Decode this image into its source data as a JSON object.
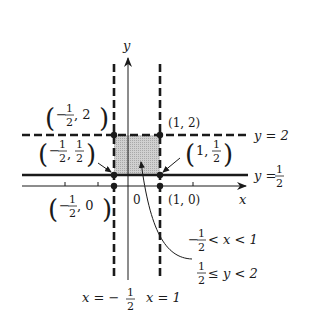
{
  "diagram": {
    "type": "coordinate-plane-region",
    "axes": {
      "x_label": "x",
      "y_label": "y",
      "origin_label": "0"
    },
    "boundary_lines": [
      {
        "id": "x_neg_half",
        "equation_lhs": "x =",
        "equation_rhs_sign": "−",
        "num": "1",
        "den": "2",
        "style": "dashed",
        "orientation": "vertical"
      },
      {
        "id": "x_one",
        "equation": "x = 1",
        "style": "dashed",
        "orientation": "vertical"
      },
      {
        "id": "y_two",
        "equation": "y = 2",
        "style": "dashed",
        "orientation": "horizontal"
      },
      {
        "id": "y_half",
        "equation_lhs": "y =",
        "num": "1",
        "den": "2",
        "style": "solid",
        "orientation": "horizontal"
      }
    ],
    "points": [
      {
        "label_x_sign": "−",
        "x_num": "1",
        "x_den": "2",
        "y": "2",
        "text": "(−1/2, 2)"
      },
      {
        "text": "(1, 2)"
      },
      {
        "label_x_sign": "−",
        "x_num": "1",
        "x_den": "2",
        "y_num": "1",
        "y_den": "2",
        "text": "(−1/2, 1/2)"
      },
      {
        "x": "1",
        "y_num": "1",
        "y_den": "2",
        "text": "(1, 1/2)"
      },
      {
        "label_x_sign": "−",
        "x_num": "1",
        "x_den": "2",
        "y": "0",
        "text": "(−1/2, 0)"
      },
      {
        "text": "(1, 0)"
      }
    ],
    "region": {
      "fill_color": "#c8c8c8",
      "inequality_x": {
        "left_sign": "−",
        "left_num": "1",
        "left_den": "2",
        "rest": "< x < 1"
      },
      "inequality_y": {
        "left_num": "1",
        "left_den": "2",
        "rest": "≤ y < 2"
      }
    }
  },
  "labels": {
    "y_axis": "y",
    "x_axis": "x",
    "origin": "0",
    "pt_neg_half_2": {
      "open": "(",
      "sign": "−",
      "num": "1",
      "den": "2",
      "comma_y": ", 2",
      "close": ")"
    },
    "pt_1_2": "(1, 2)",
    "pt_neg_half_half": {
      "open": "(",
      "sign": "−",
      "num": "1",
      "den": "2",
      "comma": ",",
      "ynum": "1",
      "yden": "2",
      "close": ")"
    },
    "pt_1_half": {
      "open": "(",
      "x": "1,",
      "num": "1",
      "den": "2",
      "close": ")"
    },
    "pt_neg_half_0": {
      "open": "(",
      "sign": "−",
      "num": "1",
      "den": "2",
      "comma_y": ", 0",
      "close": ")"
    },
    "pt_1_0": "(1, 0)",
    "line_y2": "y = 2",
    "line_yhalf_lhs": "y =",
    "line_yhalf_num": "1",
    "line_yhalf_den": "2",
    "line_xneg_lhs": "x = −",
    "line_xneg_num": "1",
    "line_xneg_den": "2",
    "line_x1": "x = 1",
    "ineq_x_sign": "−",
    "ineq_x_num": "1",
    "ineq_x_den": "2",
    "ineq_x_rest": "< x < 1",
    "ineq_y_num": "1",
    "ineq_y_den": "2",
    "ineq_y_rest": "≤ y < 2"
  },
  "colors": {
    "ink": "#1a1a1a",
    "shade": "#c8c8c8",
    "background": "#ffffff"
  }
}
